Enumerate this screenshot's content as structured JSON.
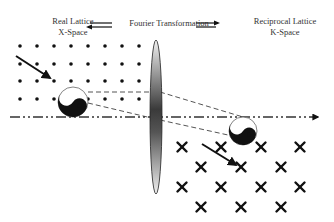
{
  "labels": {
    "real_line1": "Real Lattice",
    "real_line2": "X-Space",
    "fourier": "Fourier Transformation",
    "recip_line1": "Reciprocal Lattice",
    "recip_line2": "K-Space"
  },
  "colors": {
    "ink": "#111111",
    "dash": "#555555",
    "lens_dark": "#3a3a3a",
    "lens_light": "#e8e8e8"
  },
  "real_lattice": {
    "xs": [
      20,
      37,
      54,
      71,
      88,
      105,
      122,
      139
    ],
    "ys": [
      46,
      64,
      81,
      99
    ]
  },
  "reciprocal_lattice": {
    "rows": [
      {
        "y": 147,
        "xs": [
          182,
          221,
          261,
          300
        ]
      },
      {
        "y": 167,
        "xs": [
          201,
          241,
          281
        ]
      },
      {
        "y": 187,
        "xs": [
          182,
          221,
          261,
          300
        ]
      },
      {
        "y": 207,
        "xs": [
          201,
          241,
          281
        ]
      }
    ]
  },
  "lens": {
    "cx": 156,
    "cy": 117,
    "rx": 6,
    "ry": 77
  },
  "optical_axis": {
    "y": 117,
    "x1": 10,
    "x2": 318
  },
  "yin_yang_left": {
    "cx": 73,
    "cy": 102,
    "r": 15
  },
  "yin_yang_right": {
    "cx": 243,
    "cy": 131,
    "r": 14
  }
}
